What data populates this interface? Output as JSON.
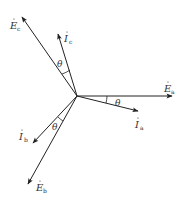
{
  "diagram": {
    "type": "phasor-diagram",
    "origin": {
      "x": 77,
      "y": 96
    },
    "stroke_color": "#222222",
    "label_color": "#333333",
    "phasors": [
      {
        "id": "Ea",
        "symbol": "E",
        "subscript": "a",
        "kind": "voltage",
        "tip": {
          "x": 172,
          "y": 96
        },
        "label_pos": {
          "x": 164,
          "y": 88
        }
      },
      {
        "id": "Ia",
        "symbol": "I",
        "subscript": "a",
        "kind": "current",
        "tip": {
          "x": 138,
          "y": 111
        },
        "label_pos": {
          "x": 135,
          "y": 126
        }
      },
      {
        "id": "Ec",
        "symbol": "E",
        "subscript": "c",
        "kind": "voltage",
        "tip": {
          "x": 22,
          "y": 17
        },
        "label_pos": {
          "x": 10,
          "y": 30
        }
      },
      {
        "id": "Ic",
        "symbol": "I",
        "subscript": "c",
        "kind": "current",
        "tip": {
          "x": 58,
          "y": 34
        },
        "label_pos": {
          "x": 64,
          "y": 40
        }
      },
      {
        "id": "Eb",
        "symbol": "E",
        "subscript": "b",
        "kind": "voltage",
        "tip": {
          "x": 28,
          "y": 184
        },
        "label_pos": {
          "x": 36,
          "y": 190
        }
      },
      {
        "id": "Ib",
        "symbol": "I",
        "subscript": "b",
        "kind": "current",
        "tip": {
          "x": 33,
          "y": 143
        },
        "label_pos": {
          "x": 19,
          "y": 140
        }
      }
    ],
    "angles": [
      {
        "id": "theta-a",
        "label": "θ",
        "label_pos": {
          "x": 115,
          "y": 104
        }
      },
      {
        "id": "theta-c",
        "label": "θ",
        "label_pos": {
          "x": 57,
          "y": 65
        }
      },
      {
        "id": "theta-b",
        "label": "θ",
        "label_pos": {
          "x": 53,
          "y": 128
        }
      }
    ]
  }
}
